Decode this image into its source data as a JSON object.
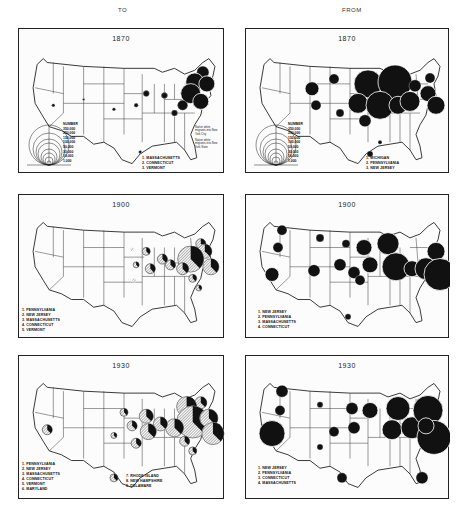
{
  "columns": {
    "left": "TO",
    "right": "FROM"
  },
  "colors": {
    "ink": "#111111",
    "paper": "#fcfcfc",
    "hatch": "#9a9a9a"
  },
  "scale": {
    "title": "NUMBER",
    "values": [
      "350,000",
      "250,000",
      "150,000",
      "100,000",
      "50,000",
      "30,000",
      "10,000",
      "1,000"
    ]
  },
  "key": {
    "city": "Native white migrants into New York City",
    "state": "Native white migrants into New York State"
  },
  "panels": [
    {
      "id": "to-1870",
      "column": "TO",
      "year": "1870",
      "legend": [
        "1. MASSACHUSETTS",
        "2. CONNECTICUT",
        "3. VERMONT"
      ]
    },
    {
      "id": "from-1870",
      "column": "FROM",
      "year": "1870",
      "legend": [
        "1. MICHIGAN",
        "2. PENNSYLVANIA",
        "3. NEW JERSEY"
      ]
    },
    {
      "id": "to-1900",
      "column": "TO",
      "year": "1900",
      "legend": [
        "1. PENNSYLVANIA",
        "2. NEW JERSEY",
        "3. MASSACHUSETTS",
        "4. CONNECTICUT",
        "5. VERMONT"
      ]
    },
    {
      "id": "from-1900",
      "column": "FROM",
      "year": "1900",
      "legend": [
        "1. NEW JERSEY",
        "2. PENNSYLVANIA",
        "3. MASSACHUSETTS",
        "4. CONNECTICUT"
      ]
    },
    {
      "id": "to-1930",
      "column": "TO",
      "year": "1930",
      "legend": [
        "1. PENNSYLVANIA",
        "2. NEW JERSEY",
        "3. MASSACHUSETTS",
        "4. CONNECTICUT",
        "5. VERMONT",
        "6. MARYLAND"
      ],
      "legend2": [
        "7. RHODE ISLAND",
        "8. NEW HAMPSHIRE",
        "9. DELAWARE"
      ]
    },
    {
      "id": "from-1930",
      "column": "FROM",
      "year": "1930",
      "legend": [
        "1. NEW JERSEY",
        "2. PENNSYLVANIA",
        "3. CONNECTICUT",
        "4. MASSACHUSETTS"
      ]
    }
  ]
}
